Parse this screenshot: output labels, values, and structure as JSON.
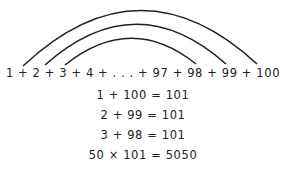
{
  "diagram": {
    "sequence": "1 + 2 + 3 + 4 + . . . + 97 + 98 + 99 + 100",
    "arcs": [
      {
        "name": "outer",
        "connects": [
          "1",
          "100"
        ]
      },
      {
        "name": "middle",
        "connects": [
          "2",
          "99"
        ]
      },
      {
        "name": "inner",
        "connects": [
          "3",
          "98"
        ]
      }
    ],
    "equations": [
      "1 + 100 = 101",
      "2 + 99 = 101",
      "3 + 98 = 101",
      "50 × 101 = 5050"
    ],
    "colors": {
      "stroke": "#222222",
      "text": "#222222",
      "background": "#ffffff"
    }
  }
}
